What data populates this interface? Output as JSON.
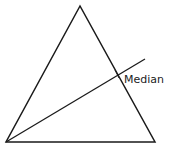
{
  "diagram": {
    "type": "triangle-with-median",
    "triangle": {
      "vertices": [
        [
          80,
          6
        ],
        [
          6,
          142
        ],
        [
          155,
          142
        ]
      ]
    },
    "median": {
      "from": [
        6,
        142
      ],
      "to": [
        145,
        59
      ],
      "label": "Median",
      "tick_at": [
        118,
        74
      ]
    },
    "stroke_color": "#1a1a1a"
  }
}
